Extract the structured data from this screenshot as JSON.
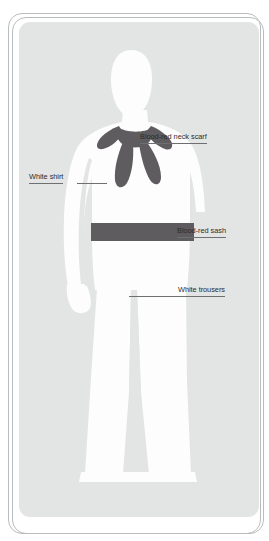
{
  "diagram": {
    "kind": "costume-design-annotation-card",
    "panel_color": "#e3e4e4",
    "frame_color": "#b9bcbe",
    "figure_color": "#fdfdfd",
    "accent_color": "#5e5c5e",
    "label_text_color": "#2b2b2b",
    "leader_line_color": "#6d6f72"
  },
  "labels": [
    {
      "id": "neck-scarf",
      "text": "Blood-red neck scarf",
      "part": "scarf",
      "color_name": "blood-red"
    },
    {
      "id": "shirt",
      "text": "White shirt",
      "part": "shirt",
      "color_name": "white"
    },
    {
      "id": "sash",
      "text": "Blood-red sash",
      "part": "sash",
      "color_name": "blood-red"
    },
    {
      "id": "trousers",
      "text": "White trousers",
      "part": "trousers",
      "color_name": "white"
    }
  ]
}
